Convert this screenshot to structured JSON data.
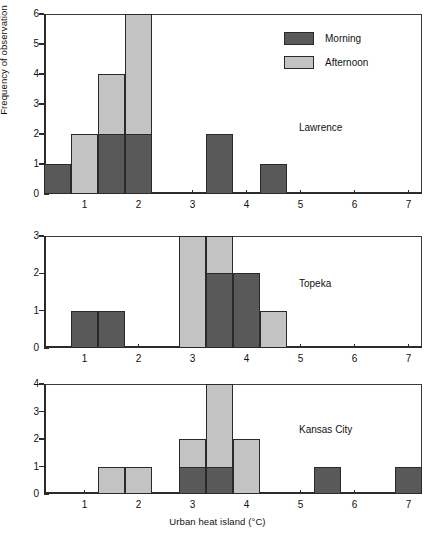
{
  "chart_data": {
    "type": "bar",
    "title": "",
    "xlabel": "Urban heat island (°C)",
    "ylabel": "Frequency of observation",
    "grid": false,
    "bin_width": 0.5,
    "xlim": [
      0.25,
      7.25
    ],
    "xticks": [
      1,
      2,
      3,
      4,
      5,
      6,
      7
    ],
    "xticklabels": [
      "1",
      "2",
      "3",
      "4",
      "5",
      "6",
      "7"
    ],
    "legend": {
      "position": "top-right of first panel",
      "entries": [
        {
          "name": "Morning",
          "color": "#595959"
        },
        {
          "name": "Afternoon",
          "color": "#c3c3c3"
        }
      ]
    },
    "series_names": [
      "Morning",
      "Afternoon"
    ],
    "panels": [
      {
        "name": "Lawrence",
        "ylim": [
          0,
          6
        ],
        "yticks": [
          0,
          1,
          2,
          3,
          4,
          5,
          6
        ],
        "yticklabels": [
          "0",
          "1",
          "2",
          "3",
          "4",
          "5",
          "6"
        ],
        "bins": [
          {
            "start": 0.25,
            "end": 0.75,
            "morning": 1,
            "afternoon": 0
          },
          {
            "start": 0.75,
            "end": 1.25,
            "morning": 0,
            "afternoon": 2
          },
          {
            "start": 1.25,
            "end": 1.75,
            "morning": 2,
            "afternoon": 4
          },
          {
            "start": 1.75,
            "end": 2.25,
            "morning": 2,
            "afternoon": 6
          },
          {
            "start": 2.25,
            "end": 2.75,
            "morning": 0,
            "afternoon": 0
          },
          {
            "start": 2.75,
            "end": 3.25,
            "morning": 0,
            "afternoon": 0
          },
          {
            "start": 3.25,
            "end": 3.75,
            "morning": 2,
            "afternoon": 0
          },
          {
            "start": 3.75,
            "end": 4.25,
            "morning": 0,
            "afternoon": 0
          },
          {
            "start": 4.25,
            "end": 4.75,
            "morning": 1,
            "afternoon": 0
          },
          {
            "start": 4.75,
            "end": 5.25,
            "morning": 0,
            "afternoon": 0
          },
          {
            "start": 5.25,
            "end": 5.75,
            "morning": 0,
            "afternoon": 0
          },
          {
            "start": 5.75,
            "end": 6.25,
            "morning": 0,
            "afternoon": 0
          },
          {
            "start": 6.25,
            "end": 6.75,
            "morning": 0,
            "afternoon": 0
          },
          {
            "start": 6.75,
            "end": 7.25,
            "morning": 0,
            "afternoon": 0
          }
        ]
      },
      {
        "name": "Topeka",
        "ylim": [
          0,
          3
        ],
        "yticks": [
          0,
          1,
          2,
          3
        ],
        "yticklabels": [
          "0",
          "1",
          "2",
          "3"
        ],
        "bins": [
          {
            "start": 0.25,
            "end": 0.75,
            "morning": 0,
            "afternoon": 0
          },
          {
            "start": 0.75,
            "end": 1.25,
            "morning": 1,
            "afternoon": 0
          },
          {
            "start": 1.25,
            "end": 1.75,
            "morning": 1,
            "afternoon": 0
          },
          {
            "start": 1.75,
            "end": 2.25,
            "morning": 0,
            "afternoon": 0
          },
          {
            "start": 2.25,
            "end": 2.75,
            "morning": 0,
            "afternoon": 0
          },
          {
            "start": 2.75,
            "end": 3.25,
            "morning": 0,
            "afternoon": 3
          },
          {
            "start": 3.25,
            "end": 3.75,
            "morning": 2,
            "afternoon": 3
          },
          {
            "start": 3.75,
            "end": 4.25,
            "morning": 2,
            "afternoon": 0
          },
          {
            "start": 4.25,
            "end": 4.75,
            "morning": 0,
            "afternoon": 1
          },
          {
            "start": 4.75,
            "end": 5.25,
            "morning": 0,
            "afternoon": 0
          },
          {
            "start": 5.25,
            "end": 5.75,
            "morning": 0,
            "afternoon": 0
          },
          {
            "start": 5.75,
            "end": 6.25,
            "morning": 0,
            "afternoon": 0
          },
          {
            "start": 6.25,
            "end": 6.75,
            "morning": 0,
            "afternoon": 0
          },
          {
            "start": 6.75,
            "end": 7.25,
            "morning": 0,
            "afternoon": 0
          }
        ]
      },
      {
        "name": "Kansas City",
        "ylim": [
          0,
          4
        ],
        "yticks": [
          0,
          1,
          2,
          3,
          4
        ],
        "yticklabels": [
          "0",
          "1",
          "2",
          "3",
          "4"
        ],
        "bins": [
          {
            "start": 0.25,
            "end": 0.75,
            "morning": 0,
            "afternoon": 0
          },
          {
            "start": 0.75,
            "end": 1.25,
            "morning": 0,
            "afternoon": 0
          },
          {
            "start": 1.25,
            "end": 1.75,
            "morning": 0,
            "afternoon": 1
          },
          {
            "start": 1.75,
            "end": 2.25,
            "morning": 0,
            "afternoon": 1
          },
          {
            "start": 2.25,
            "end": 2.75,
            "morning": 0,
            "afternoon": 0
          },
          {
            "start": 2.75,
            "end": 3.25,
            "morning": 1,
            "afternoon": 2
          },
          {
            "start": 3.25,
            "end": 3.75,
            "morning": 1,
            "afternoon": 4
          },
          {
            "start": 3.75,
            "end": 4.25,
            "morning": 0,
            "afternoon": 2
          },
          {
            "start": 4.25,
            "end": 4.75,
            "morning": 0,
            "afternoon": 0
          },
          {
            "start": 4.75,
            "end": 5.25,
            "morning": 0,
            "afternoon": 0
          },
          {
            "start": 5.25,
            "end": 5.75,
            "morning": 1,
            "afternoon": 0
          },
          {
            "start": 5.75,
            "end": 6.25,
            "morning": 0,
            "afternoon": 0
          },
          {
            "start": 6.25,
            "end": 6.75,
            "morning": 0,
            "afternoon": 0
          },
          {
            "start": 6.75,
            "end": 7.25,
            "morning": 1,
            "afternoon": 0
          }
        ]
      }
    ]
  }
}
